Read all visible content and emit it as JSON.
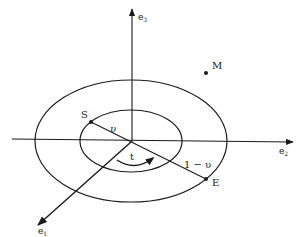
{
  "diagram": {
    "type": "orbital-geometry",
    "axes": {
      "e1": {
        "label": "e",
        "subscript": "1"
      },
      "e2": {
        "label": "e",
        "subscript": "2"
      },
      "e3": {
        "label": "e",
        "subscript": "3"
      }
    },
    "points": {
      "S": {
        "label": "S"
      },
      "E": {
        "label": "E"
      },
      "M": {
        "label": "M"
      }
    },
    "segments": {
      "inner": {
        "label": "υ"
      },
      "outer": {
        "label": "1 − υ"
      }
    },
    "rotation": {
      "label": "t"
    },
    "colors": {
      "stroke": "#1a1a1a",
      "background": "#ffffff"
    }
  }
}
